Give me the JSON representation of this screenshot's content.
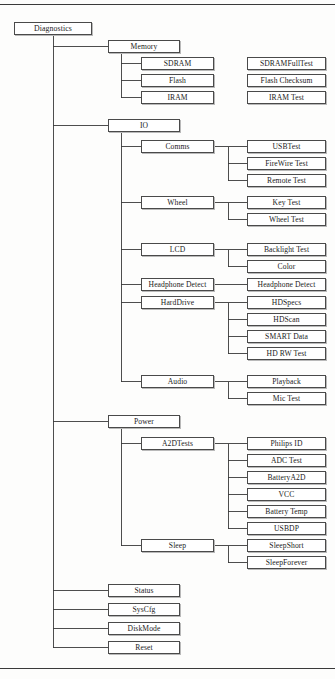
{
  "diagram": {
    "type": "tree",
    "title": "Diagnostics",
    "orientation": "left-to-right",
    "colors": {
      "box_border": "#4a4a4a",
      "box_fill": "#ffffff",
      "box_shadow": "#b9b9b9",
      "edge": "#3a3a3a",
      "text": "#1b1b1b",
      "page_background": "#fdfdfc",
      "rule": "#3a3a3a"
    },
    "columns": {
      "col1_x": 14,
      "col1_w": 78,
      "col2_x": 108,
      "col2_w": 72,
      "col3_x": 141,
      "col3_w": 73,
      "col4_x": 247,
      "col4_w": 79
    },
    "rules": [
      {
        "name": "rule-top",
        "y": 4
      },
      {
        "name": "rule-bottom",
        "y": 668
      }
    ],
    "nodes": [
      {
        "id": "diagnostics",
        "label": "Diagnostics",
        "level": 1,
        "x": 14,
        "y": 22,
        "w": 78,
        "h": 13
      },
      {
        "id": "memory",
        "label": "Memory",
        "level": 2,
        "x": 108,
        "y": 40,
        "w": 72,
        "h": 13
      },
      {
        "id": "sdram",
        "label": "SDRAM",
        "level": 3,
        "x": 141,
        "y": 57,
        "w": 73,
        "h": 13
      },
      {
        "id": "sdramfulltest",
        "label": "SDRAMFullTest",
        "level": 4,
        "x": 247,
        "y": 57,
        "w": 79,
        "h": 13
      },
      {
        "id": "flash",
        "label": "Flash",
        "level": 3,
        "x": 141,
        "y": 74,
        "w": 73,
        "h": 13
      },
      {
        "id": "flash-checksum",
        "label": "Flash Checksum",
        "level": 4,
        "x": 247,
        "y": 74,
        "w": 79,
        "h": 13
      },
      {
        "id": "iram",
        "label": "IRAM",
        "level": 3,
        "x": 141,
        "y": 91,
        "w": 73,
        "h": 13
      },
      {
        "id": "iram-test",
        "label": "IRAM Test",
        "level": 4,
        "x": 247,
        "y": 91,
        "w": 79,
        "h": 13
      },
      {
        "id": "io",
        "label": "IO",
        "level": 2,
        "x": 108,
        "y": 119,
        "w": 72,
        "h": 13
      },
      {
        "id": "comms",
        "label": "Comms",
        "level": 3,
        "x": 141,
        "y": 140,
        "w": 73,
        "h": 13
      },
      {
        "id": "usbtest",
        "label": "USBTest",
        "level": 4,
        "x": 247,
        "y": 140,
        "w": 79,
        "h": 13
      },
      {
        "id": "firewire-test",
        "label": "FireWire Test",
        "level": 4,
        "x": 247,
        "y": 157,
        "w": 79,
        "h": 13
      },
      {
        "id": "remote-test",
        "label": "Remote Test",
        "level": 4,
        "x": 247,
        "y": 174,
        "w": 79,
        "h": 13
      },
      {
        "id": "wheel",
        "label": "Wheel",
        "level": 3,
        "x": 141,
        "y": 196,
        "w": 73,
        "h": 13
      },
      {
        "id": "key-test",
        "label": "Key Test",
        "level": 4,
        "x": 247,
        "y": 196,
        "w": 79,
        "h": 13
      },
      {
        "id": "wheel-test",
        "label": "Wheel Test",
        "level": 4,
        "x": 247,
        "y": 213,
        "w": 79,
        "h": 13
      },
      {
        "id": "lcd",
        "label": "LCD",
        "level": 3,
        "x": 141,
        "y": 243,
        "w": 73,
        "h": 13
      },
      {
        "id": "backlight-test",
        "label": "Backlight Test",
        "level": 4,
        "x": 247,
        "y": 243,
        "w": 79,
        "h": 13
      },
      {
        "id": "color",
        "label": "Color",
        "level": 4,
        "x": 247,
        "y": 260,
        "w": 79,
        "h": 13
      },
      {
        "id": "headphone-detect",
        "label": "Headphone Detect",
        "level": 3,
        "x": 141,
        "y": 278,
        "w": 73,
        "h": 13
      },
      {
        "id": "headphone-detect-leaf",
        "label": "Headphone Detect",
        "level": 4,
        "x": 247,
        "y": 278,
        "w": 79,
        "h": 13
      },
      {
        "id": "harddrive",
        "label": "HardDrive",
        "level": 3,
        "x": 141,
        "y": 296,
        "w": 73,
        "h": 13
      },
      {
        "id": "hdspecs",
        "label": "HDSpecs",
        "level": 4,
        "x": 247,
        "y": 296,
        "w": 79,
        "h": 13
      },
      {
        "id": "hdscan",
        "label": "HDScan",
        "level": 4,
        "x": 247,
        "y": 313,
        "w": 79,
        "h": 13
      },
      {
        "id": "smart-data",
        "label": "SMART Data",
        "level": 4,
        "x": 247,
        "y": 330,
        "w": 79,
        "h": 13
      },
      {
        "id": "hd-rw-test",
        "label": "HD RW Test",
        "level": 4,
        "x": 247,
        "y": 347,
        "w": 79,
        "h": 13
      },
      {
        "id": "audio",
        "label": "Audio",
        "level": 3,
        "x": 141,
        "y": 375,
        "w": 73,
        "h": 13
      },
      {
        "id": "playback",
        "label": "Playback",
        "level": 4,
        "x": 247,
        "y": 375,
        "w": 79,
        "h": 13
      },
      {
        "id": "mic-test",
        "label": "Mic Test",
        "level": 4,
        "x": 247,
        "y": 392,
        "w": 79,
        "h": 13
      },
      {
        "id": "power",
        "label": "Power",
        "level": 2,
        "x": 108,
        "y": 415,
        "w": 72,
        "h": 13
      },
      {
        "id": "a2dtests",
        "label": "A2DTests",
        "level": 3,
        "x": 141,
        "y": 437,
        "w": 73,
        "h": 13
      },
      {
        "id": "philips-id",
        "label": "Philips ID",
        "level": 4,
        "x": 247,
        "y": 437,
        "w": 79,
        "h": 13
      },
      {
        "id": "adc-test",
        "label": "ADC Test",
        "level": 4,
        "x": 247,
        "y": 454,
        "w": 79,
        "h": 13
      },
      {
        "id": "batterya2d",
        "label": "BatteryA2D",
        "level": 4,
        "x": 247,
        "y": 471,
        "w": 79,
        "h": 13
      },
      {
        "id": "vcc",
        "label": "VCC",
        "level": 4,
        "x": 247,
        "y": 488,
        "w": 79,
        "h": 13
      },
      {
        "id": "battery-temp",
        "label": "Battery Temp",
        "level": 4,
        "x": 247,
        "y": 505,
        "w": 79,
        "h": 13
      },
      {
        "id": "usbdp",
        "label": "USBDP",
        "level": 4,
        "x": 247,
        "y": 522,
        "w": 79,
        "h": 13
      },
      {
        "id": "sleep",
        "label": "Sleep",
        "level": 3,
        "x": 141,
        "y": 539,
        "w": 73,
        "h": 13
      },
      {
        "id": "sleepshort",
        "label": "SleepShort",
        "level": 4,
        "x": 247,
        "y": 539,
        "w": 79,
        "h": 13
      },
      {
        "id": "sleepforever",
        "label": "SleepForever",
        "level": 4,
        "x": 247,
        "y": 556,
        "w": 79,
        "h": 13
      },
      {
        "id": "status",
        "label": "Status",
        "level": 2,
        "x": 108,
        "y": 584,
        "w": 72,
        "h": 13
      },
      {
        "id": "syscfg",
        "label": "SysCfg",
        "level": 2,
        "x": 108,
        "y": 603,
        "w": 72,
        "h": 13
      },
      {
        "id": "diskmode",
        "label": "DiskMode",
        "level": 2,
        "x": 108,
        "y": 622,
        "w": 72,
        "h": 13
      },
      {
        "id": "reset",
        "label": "Reset",
        "level": 2,
        "x": 108,
        "y": 641,
        "w": 72,
        "h": 13
      }
    ],
    "edges": [
      {
        "parent": "diagnostics",
        "children": [
          "memory",
          "io",
          "power",
          "status",
          "syscfg",
          "diskmode",
          "reset"
        ],
        "bus_x": 53
      },
      {
        "parent": "memory",
        "children": [
          "sdram",
          "flash",
          "iram"
        ],
        "bus_x": 121
      },
      {
        "parent": "io",
        "children": [
          "comms",
          "wheel",
          "lcd",
          "headphone-detect",
          "harddrive",
          "audio"
        ],
        "bus_x": 121
      },
      {
        "parent": "power",
        "children": [
          "a2dtests",
          "sleep"
        ],
        "bus_x": 121
      },
      {
        "parent": "comms",
        "children": [
          "usbtest",
          "firewire-test",
          "remote-test"
        ],
        "bus_x": 228
      },
      {
        "parent": "wheel",
        "children": [
          "key-test",
          "wheel-test"
        ],
        "bus_x": 228
      },
      {
        "parent": "lcd",
        "children": [
          "backlight-test",
          "color"
        ],
        "bus_x": 228
      },
      {
        "parent": "headphone-detect",
        "children": [
          "headphone-detect-leaf"
        ],
        "bus_x": 228
      },
      {
        "parent": "harddrive",
        "children": [
          "hdspecs",
          "hdscan",
          "smart-data",
          "hd-rw-test"
        ],
        "bus_x": 228
      },
      {
        "parent": "audio",
        "children": [
          "playback",
          "mic-test"
        ],
        "bus_x": 228
      },
      {
        "parent": "a2dtests",
        "children": [
          "philips-id",
          "adc-test",
          "batterya2d",
          "vcc",
          "battery-temp",
          "usbdp"
        ],
        "bus_x": 228
      },
      {
        "parent": "sleep",
        "children": [
          "sleepshort",
          "sleepforever"
        ],
        "bus_x": 228
      }
    ]
  }
}
